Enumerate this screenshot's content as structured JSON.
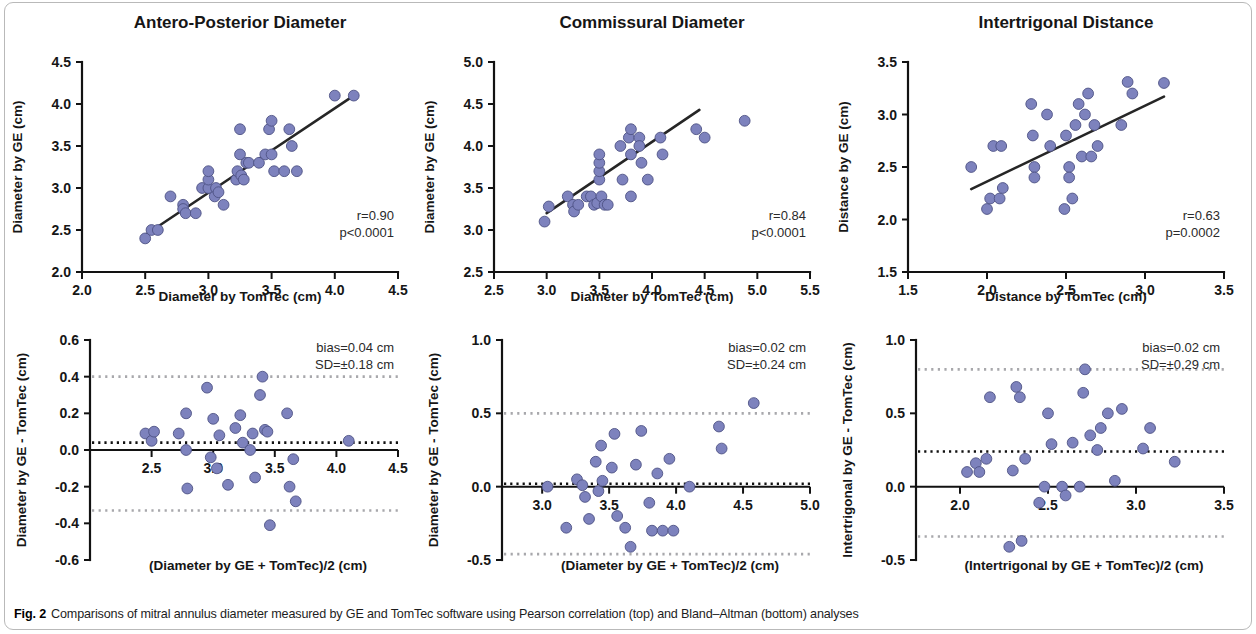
{
  "figure": {
    "caption_label": "Fig. 2",
    "caption_text": "Comparisons of mitral annulus diameter measured by GE and TomTec software using Pearson correlation (top) and Bland–Altman (bottom) analyses",
    "marker_color": "#7d82bd",
    "marker_edge_color": "#4e5284",
    "line_color": "#262626",
    "loa_color": "#a8a8ac",
    "border_color": "#b9b9b9"
  },
  "chart_data": [
    {
      "id": "ap-correlation",
      "panel": "top-left",
      "type": "scatter",
      "title": "Antero-Posterior Diameter",
      "xlabel": "Diameter by TomTec (cm)",
      "ylabel": "Diameter by GE (cm)",
      "xlim": [
        2.0,
        4.5
      ],
      "ylim": [
        2.0,
        4.5
      ],
      "xticks": [
        2.0,
        2.5,
        3.0,
        3.5,
        4.0,
        4.5
      ],
      "yticks": [
        2.0,
        2.5,
        3.0,
        3.5,
        4.0,
        4.5
      ],
      "xticklabels": [
        "2.0",
        "2.5",
        "3.0",
        "3.5",
        "4.0",
        "4.5"
      ],
      "yticklabels": [
        "2.0",
        "2.5",
        "3.0",
        "3.5",
        "4.0",
        "4.5"
      ],
      "grid": false,
      "annotations": [
        "r=0.90",
        "p<0.0001"
      ],
      "stats": {
        "r": "0.90",
        "p": "p<0.0001"
      },
      "fit_line": {
        "x": [
          2.48,
          4.15
        ],
        "y": [
          2.42,
          4.1
        ]
      },
      "points": [
        [
          2.5,
          2.4
        ],
        [
          2.55,
          2.5
        ],
        [
          2.6,
          2.5
        ],
        [
          2.7,
          2.9
        ],
        [
          2.8,
          2.8
        ],
        [
          2.8,
          2.75
        ],
        [
          2.82,
          2.7
        ],
        [
          2.9,
          2.7
        ],
        [
          2.95,
          3.0
        ],
        [
          3.0,
          3.0
        ],
        [
          3.0,
          3.1
        ],
        [
          3.0,
          3.2
        ],
        [
          3.05,
          2.9
        ],
        [
          3.06,
          3.0
        ],
        [
          3.08,
          2.95
        ],
        [
          3.12,
          2.8
        ],
        [
          3.22,
          3.1
        ],
        [
          3.23,
          3.2
        ],
        [
          3.25,
          3.4
        ],
        [
          3.25,
          3.7
        ],
        [
          3.26,
          3.15
        ],
        [
          3.28,
          3.1
        ],
        [
          3.3,
          3.3
        ],
        [
          3.32,
          3.3
        ],
        [
          3.4,
          3.3
        ],
        [
          3.45,
          3.4
        ],
        [
          3.48,
          3.7
        ],
        [
          3.5,
          3.8
        ],
        [
          3.5,
          3.4
        ],
        [
          3.52,
          3.2
        ],
        [
          3.6,
          3.2
        ],
        [
          3.64,
          3.7
        ],
        [
          3.66,
          3.5
        ],
        [
          3.7,
          3.2
        ],
        [
          4.0,
          4.1
        ],
        [
          4.15,
          4.1
        ]
      ]
    },
    {
      "id": "cm-correlation",
      "panel": "top-middle",
      "type": "scatter",
      "title": "Commissural Diameter",
      "xlabel": "Diameter by TomTec (cm)",
      "ylabel": "Diameter by GE (cm)",
      "xlim": [
        2.5,
        5.5
      ],
      "ylim": [
        2.5,
        5.0
      ],
      "xticks": [
        2.5,
        3.0,
        3.5,
        4.0,
        4.5,
        5.0,
        5.5
      ],
      "yticks": [
        2.5,
        3.0,
        3.5,
        4.0,
        4.5,
        5.0
      ],
      "xticklabels": [
        "2.5",
        "3.0",
        "3.5",
        "4.0",
        "4.5",
        "5.0",
        "5.5"
      ],
      "yticklabels": [
        "2.5",
        "3.0",
        "3.5",
        "4.0",
        "4.5",
        "5.0"
      ],
      "grid": false,
      "annotations": [
        "r=0.84",
        "p<0.0001"
      ],
      "stats": {
        "r": "0.84",
        "p": "p<0.0001"
      },
      "fit_line": {
        "x": [
          3.0,
          4.45
        ],
        "y": [
          3.2,
          4.43
        ]
      },
      "points": [
        [
          2.98,
          3.1
        ],
        [
          3.02,
          3.28
        ],
        [
          3.2,
          3.4
        ],
        [
          3.25,
          3.3
        ],
        [
          3.26,
          3.22
        ],
        [
          3.3,
          3.3
        ],
        [
          3.38,
          3.4
        ],
        [
          3.42,
          3.4
        ],
        [
          3.45,
          3.3
        ],
        [
          3.48,
          3.32
        ],
        [
          3.5,
          3.6
        ],
        [
          3.5,
          3.7
        ],
        [
          3.5,
          3.8
        ],
        [
          3.5,
          3.9
        ],
        [
          3.52,
          3.4
        ],
        [
          3.55,
          3.3
        ],
        [
          3.58,
          3.3
        ],
        [
          3.7,
          4.0
        ],
        [
          3.72,
          3.6
        ],
        [
          3.78,
          4.1
        ],
        [
          3.8,
          4.2
        ],
        [
          3.8,
          3.9
        ],
        [
          3.8,
          3.4
        ],
        [
          3.88,
          4.1
        ],
        [
          3.88,
          4.0
        ],
        [
          3.9,
          3.8
        ],
        [
          3.96,
          3.6
        ],
        [
          4.08,
          4.1
        ],
        [
          4.1,
          3.9
        ],
        [
          4.42,
          4.2
        ],
        [
          4.5,
          4.1
        ],
        [
          4.88,
          4.3
        ]
      ]
    },
    {
      "id": "it-correlation",
      "panel": "top-right",
      "type": "scatter",
      "title": "Intertrigonal Distance",
      "xlabel": "Distance by TomTec (cm)",
      "ylabel": "Distance by GE (cm)",
      "xlim": [
        1.5,
        3.5
      ],
      "ylim": [
        1.5,
        3.5
      ],
      "xticks": [
        1.5,
        2.0,
        2.5,
        3.0,
        3.5
      ],
      "yticks": [
        1.5,
        2.0,
        2.5,
        3.0,
        3.5
      ],
      "xticklabels": [
        "1.5",
        "2.0",
        "2.5",
        "3.0",
        "3.5"
      ],
      "yticklabels": [
        "1.5",
        "2.0",
        "2.5",
        "3.0",
        "3.5"
      ],
      "grid": false,
      "annotations": [
        "r=0.63",
        "p=0.0002"
      ],
      "stats": {
        "r": "0.63",
        "p": "p=0.0002"
      },
      "fit_line": {
        "x": [
          1.9,
          3.12
        ],
        "y": [
          2.29,
          3.17
        ]
      },
      "points": [
        [
          1.9,
          2.5
        ],
        [
          2.0,
          2.1
        ],
        [
          2.02,
          2.2
        ],
        [
          2.04,
          2.7
        ],
        [
          2.08,
          2.2
        ],
        [
          2.09,
          2.7
        ],
        [
          2.1,
          2.3
        ],
        [
          2.28,
          3.1
        ],
        [
          2.29,
          2.8
        ],
        [
          2.3,
          2.5
        ],
        [
          2.3,
          2.4
        ],
        [
          2.38,
          3.0
        ],
        [
          2.4,
          2.7
        ],
        [
          2.49,
          2.1
        ],
        [
          2.5,
          2.8
        ],
        [
          2.52,
          2.5
        ],
        [
          2.52,
          2.4
        ],
        [
          2.54,
          2.2
        ],
        [
          2.56,
          2.9
        ],
        [
          2.58,
          3.1
        ],
        [
          2.6,
          2.6
        ],
        [
          2.62,
          3.0
        ],
        [
          2.64,
          3.2
        ],
        [
          2.66,
          2.6
        ],
        [
          2.68,
          2.9
        ],
        [
          2.7,
          2.7
        ],
        [
          2.85,
          2.9
        ],
        [
          2.89,
          3.31
        ],
        [
          2.92,
          3.2
        ],
        [
          3.12,
          3.3
        ]
      ]
    },
    {
      "id": "ap-bland-altman",
      "panel": "bottom-left",
      "type": "scatter",
      "title": "",
      "xlabel": "(Diameter by GE + TomTec)/2 (cm)",
      "ylabel": "Diameter by GE - TomTec (cm)",
      "xlim": [
        2.0,
        4.5
      ],
      "ylim": [
        -0.6,
        0.6
      ],
      "xticks": [
        2.5,
        3.0,
        3.5,
        4.0,
        4.5
      ],
      "yticks": [
        -0.6,
        -0.4,
        -0.2,
        0.0,
        0.2,
        0.4,
        0.6
      ],
      "xticklabels": [
        "2.5",
        "3.0",
        "3.5",
        "4.0",
        "4.5"
      ],
      "yticklabels": [
        "-0.6",
        "-0.4",
        "-0.2",
        "0.0",
        "0.2",
        "0.4",
        "0.6"
      ],
      "grid": false,
      "annotations": [
        "bias=0.04 cm",
        "SD=±0.18 cm"
      ],
      "stats": {
        "bias": "0.04",
        "sd": "0.18",
        "bias_label": "bias=0.04 cm",
        "sd_label": "SD=±0.18 cm"
      },
      "bias_line": 0.04,
      "loa_upper": 0.4,
      "loa_lower": -0.33,
      "zero_line": 0.0,
      "points": [
        [
          2.45,
          0.09
        ],
        [
          2.5,
          0.05
        ],
        [
          2.52,
          0.1
        ],
        [
          2.72,
          0.09
        ],
        [
          2.78,
          0.2
        ],
        [
          2.78,
          0.0
        ],
        [
          2.79,
          -0.21
        ],
        [
          2.95,
          0.34
        ],
        [
          2.98,
          -0.04
        ],
        [
          3.0,
          0.17
        ],
        [
          3.03,
          -0.1
        ],
        [
          3.05,
          0.08
        ],
        [
          3.12,
          -0.19
        ],
        [
          3.18,
          0.12
        ],
        [
          3.22,
          0.19
        ],
        [
          3.24,
          0.04
        ],
        [
          3.3,
          0.0
        ],
        [
          3.32,
          0.09
        ],
        [
          3.34,
          -0.15
        ],
        [
          3.38,
          0.3
        ],
        [
          3.4,
          0.4
        ],
        [
          3.42,
          0.11
        ],
        [
          3.44,
          0.1
        ],
        [
          3.46,
          -0.41
        ],
        [
          3.6,
          0.2
        ],
        [
          3.62,
          -0.2
        ],
        [
          3.65,
          -0.05
        ],
        [
          3.67,
          -0.28
        ],
        [
          4.1,
          0.05
        ]
      ]
    },
    {
      "id": "cm-bland-altman",
      "panel": "bottom-middle",
      "type": "scatter",
      "title": "",
      "xlabel": "(Diameter by GE + TomTec)/2 (cm)",
      "ylabel": "Diameter by GE - TomTec (cm)",
      "xlim": [
        2.7,
        5.0
      ],
      "ylim": [
        -0.5,
        1.0
      ],
      "xticks": [
        3.0,
        3.5,
        4.0,
        4.5,
        5.0
      ],
      "yticks": [
        -0.5,
        0.0,
        0.5,
        1.0
      ],
      "xticklabels": [
        "3.0",
        "3.5",
        "4.0",
        "4.5",
        "5.0"
      ],
      "yticklabels": [
        "-0.5",
        "0.0",
        "0.5",
        "1.0"
      ],
      "grid": false,
      "annotations": [
        "bias=0.02 cm",
        "SD=±0.24 cm"
      ],
      "stats": {
        "bias": "0.02",
        "sd": "0.24",
        "bias_label": "bias=0.02 cm",
        "sd_label": "SD=±0.24 cm"
      },
      "bias_line": 0.02,
      "loa_upper": 0.5,
      "loa_lower": -0.46,
      "zero_line": 0.0,
      "points": [
        [
          3.04,
          0.0
        ],
        [
          3.18,
          -0.28
        ],
        [
          3.26,
          0.05
        ],
        [
          3.3,
          0.01
        ],
        [
          3.32,
          -0.07
        ],
        [
          3.35,
          -0.22
        ],
        [
          3.4,
          0.17
        ],
        [
          3.42,
          -0.03
        ],
        [
          3.44,
          0.28
        ],
        [
          3.45,
          0.04
        ],
        [
          3.52,
          0.13
        ],
        [
          3.54,
          0.36
        ],
        [
          3.56,
          -0.2
        ],
        [
          3.62,
          -0.28
        ],
        [
          3.66,
          -0.41
        ],
        [
          3.7,
          0.15
        ],
        [
          3.74,
          0.38
        ],
        [
          3.8,
          -0.11
        ],
        [
          3.82,
          -0.3
        ],
        [
          3.86,
          0.09
        ],
        [
          3.9,
          -0.3
        ],
        [
          3.95,
          0.19
        ],
        [
          3.98,
          -0.3
        ],
        [
          4.1,
          0.0
        ],
        [
          4.32,
          0.41
        ],
        [
          4.34,
          0.26
        ],
        [
          4.58,
          0.57
        ]
      ]
    },
    {
      "id": "it-bland-altman",
      "panel": "bottom-right",
      "type": "scatter",
      "title": "",
      "xlabel": "(Intertrigonal by GE + TomTec)/2 (cm)",
      "ylabel": "Intertrigonal by GE - TomTec (cm)",
      "xlim": [
        1.75,
        3.5
      ],
      "ylim": [
        -0.5,
        1.0
      ],
      "xticks": [
        2.0,
        2.5,
        3.0,
        3.5
      ],
      "yticks": [
        -0.5,
        0.0,
        0.5,
        1.0
      ],
      "xticklabels": [
        "2.0",
        "2.5",
        "3.0",
        "3.5"
      ],
      "yticklabels": [
        "-0.5",
        "0.0",
        "0.5",
        "1.0"
      ],
      "grid": false,
      "annotations": [
        "bias=0.02 cm",
        "SD=±0.29 cm"
      ],
      "stats": {
        "bias": "0.02",
        "sd": "0.29",
        "bias_label": "bias=0.02 cm",
        "sd_label": "SD=±0.29 cm"
      },
      "bias_line": 0.24,
      "loa_upper": 0.8,
      "loa_lower": -0.34,
      "zero_line": 0.0,
      "points": [
        [
          2.04,
          0.1
        ],
        [
          2.09,
          0.16
        ],
        [
          2.11,
          0.1
        ],
        [
          2.15,
          0.19
        ],
        [
          2.17,
          0.61
        ],
        [
          2.28,
          -0.41
        ],
        [
          2.3,
          0.11
        ],
        [
          2.32,
          0.68
        ],
        [
          2.34,
          0.61
        ],
        [
          2.35,
          -0.37
        ],
        [
          2.37,
          0.19
        ],
        [
          2.45,
          -0.11
        ],
        [
          2.48,
          0.0
        ],
        [
          2.5,
          0.5
        ],
        [
          2.52,
          0.29
        ],
        [
          2.58,
          0.0
        ],
        [
          2.6,
          -0.06
        ],
        [
          2.64,
          0.3
        ],
        [
          2.68,
          0.0
        ],
        [
          2.7,
          0.64
        ],
        [
          2.71,
          0.8
        ],
        [
          2.74,
          0.35
        ],
        [
          2.78,
          0.25
        ],
        [
          2.8,
          0.4
        ],
        [
          2.84,
          0.5
        ],
        [
          2.88,
          0.04
        ],
        [
          2.92,
          0.53
        ],
        [
          3.04,
          0.26
        ],
        [
          3.08,
          0.4
        ],
        [
          3.22,
          0.17
        ]
      ]
    }
  ]
}
